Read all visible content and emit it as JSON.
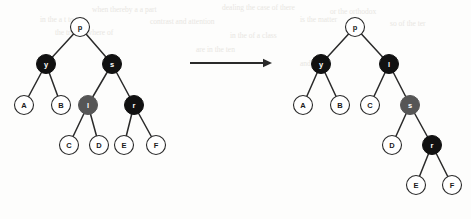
{
  "figure": {
    "arrow": {
      "name": "transformation-arrow",
      "direction": "right",
      "x1": 190,
      "y1": 63,
      "x2": 272,
      "y2": 63
    },
    "colors": {
      "black_node": "#111111",
      "gray_node": "#565656",
      "white_node": "#ffffff",
      "stroke": "#2a2a2a",
      "label_on_dark": "#ffffff",
      "label_on_light": "#1a1a1a",
      "background": "#fdfdfc",
      "bleed_text": "#e8e6e2"
    },
    "radius": 9.5,
    "left_tree": {
      "name": "before-rotation-tree",
      "nodes": [
        {
          "id": "p",
          "label": "p",
          "x": 80,
          "y": 27,
          "fill": "white"
        },
        {
          "id": "y",
          "label": "y",
          "x": 46,
          "y": 64,
          "fill": "black"
        },
        {
          "id": "s",
          "label": "s",
          "x": 112,
          "y": 64,
          "fill": "black"
        },
        {
          "id": "A",
          "label": "A",
          "x": 24,
          "y": 105,
          "fill": "white"
        },
        {
          "id": "B",
          "label": "B",
          "x": 61,
          "y": 105,
          "fill": "white"
        },
        {
          "id": "l",
          "label": "l",
          "x": 88,
          "y": 105,
          "fill": "gray"
        },
        {
          "id": "r",
          "label": "r",
          "x": 134,
          "y": 105,
          "fill": "black"
        },
        {
          "id": "C",
          "label": "C",
          "x": 69,
          "y": 145,
          "fill": "white"
        },
        {
          "id": "D",
          "label": "D",
          "x": 99,
          "y": 145,
          "fill": "white"
        },
        {
          "id": "E",
          "label": "E",
          "x": 124,
          "y": 145,
          "fill": "white"
        },
        {
          "id": "F",
          "label": "F",
          "x": 156,
          "y": 145,
          "fill": "white"
        }
      ],
      "edges": [
        [
          "p",
          "y"
        ],
        [
          "p",
          "s"
        ],
        [
          "y",
          "A"
        ],
        [
          "y",
          "B"
        ],
        [
          "s",
          "l"
        ],
        [
          "s",
          "r"
        ],
        [
          "l",
          "C"
        ],
        [
          "l",
          "D"
        ],
        [
          "r",
          "E"
        ],
        [
          "r",
          "F"
        ]
      ]
    },
    "right_tree": {
      "name": "after-rotation-tree",
      "nodes": [
        {
          "id": "p",
          "label": "p",
          "x": 355,
          "y": 27,
          "fill": "white"
        },
        {
          "id": "y",
          "label": "y",
          "x": 321,
          "y": 64,
          "fill": "black"
        },
        {
          "id": "l",
          "label": "l",
          "x": 389,
          "y": 64,
          "fill": "black"
        },
        {
          "id": "A",
          "label": "A",
          "x": 303,
          "y": 105,
          "fill": "white"
        },
        {
          "id": "B",
          "label": "B",
          "x": 340,
          "y": 105,
          "fill": "white"
        },
        {
          "id": "C",
          "label": "C",
          "x": 370,
          "y": 105,
          "fill": "white"
        },
        {
          "id": "s",
          "label": "s",
          "x": 410,
          "y": 105,
          "fill": "gray"
        },
        {
          "id": "D",
          "label": "D",
          "x": 392,
          "y": 145,
          "fill": "white"
        },
        {
          "id": "r",
          "label": "r",
          "x": 432,
          "y": 145,
          "fill": "black"
        },
        {
          "id": "E",
          "label": "E",
          "x": 416,
          "y": 185,
          "fill": "white"
        },
        {
          "id": "F",
          "label": "F",
          "x": 452,
          "y": 185,
          "fill": "white"
        }
      ],
      "edges": [
        [
          "p",
          "y"
        ],
        [
          "p",
          "l"
        ],
        [
          "y",
          "A"
        ],
        [
          "y",
          "B"
        ],
        [
          "l",
          "C"
        ],
        [
          "l",
          "s"
        ],
        [
          "s",
          "D"
        ],
        [
          "s",
          "r"
        ],
        [
          "r",
          "E"
        ],
        [
          "r",
          "F"
        ]
      ]
    },
    "bleed_text": [
      {
        "text": "when  thereby  a a part",
        "x": 92,
        "y": 4
      },
      {
        "text": "dealing the case of there",
        "x": 222,
        "y": 2
      },
      {
        "text": "or  the  orthodox",
        "x": 330,
        "y": 6
      },
      {
        "text": "in  the  a  t  to",
        "x": 40,
        "y": 14
      },
      {
        "text": "contrast  and  attention",
        "x": 150,
        "y": 16
      },
      {
        "text": "is  the  matter",
        "x": 300,
        "y": 14
      },
      {
        "text": "so  of  the  ter",
        "x": 390,
        "y": 18
      },
      {
        "text": "the  tree  in  where  of",
        "x": 55,
        "y": 27
      },
      {
        "text": "in  the  of  a  class",
        "x": 230,
        "y": 30
      },
      {
        "text": "are  in  the  ten",
        "x": 196,
        "y": 44
      },
      {
        "text": "and  by  the",
        "x": 300,
        "y": 58
      }
    ]
  }
}
